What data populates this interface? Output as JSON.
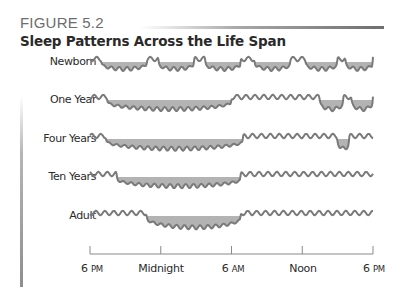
{
  "figure": {
    "label": "FIGURE 5.2",
    "title": "Sleep Patterns Across the Life Span"
  },
  "chart_data": {
    "type": "area",
    "title": "Sleep Patterns Across the Life Span",
    "xlabel": "",
    "ylabel": "",
    "x_axis": {
      "ticks": [
        "6 PM",
        "Midnight",
        "6 AM",
        "Noon",
        "6 PM"
      ],
      "range_hours": [
        0,
        24
      ],
      "start": "6 PM"
    },
    "legend": "Shaded dips below the wavy baseline indicate periods of sleep; wavy line above indicates wakefulness",
    "series": [
      {
        "name": "Newborn",
        "sleep_periods_hours": [
          [
            1.0,
            4.8
          ],
          [
            5.8,
            8.8
          ],
          [
            9.8,
            12.8
          ],
          [
            14.0,
            17.0
          ],
          [
            18.3,
            21.0
          ],
          [
            21.7,
            24.0
          ]
        ]
      },
      {
        "name": "One Year",
        "sleep_periods_hours": [
          [
            1.5,
            12.0
          ],
          [
            19.5,
            21.5
          ],
          [
            22.2,
            24.0
          ]
        ]
      },
      {
        "name": "Four Years",
        "sleep_periods_hours": [
          [
            1.4,
            13.0
          ],
          [
            21.0,
            22.0
          ]
        ]
      },
      {
        "name": "Ten Years",
        "sleep_periods_hours": [
          [
            2.3,
            12.8
          ]
        ]
      },
      {
        "name": "Adult",
        "sleep_periods_hours": [
          [
            4.8,
            12.8
          ]
        ]
      }
    ]
  },
  "rows": [
    {
      "label": "Newborn"
    },
    {
      "label": "One Year"
    },
    {
      "label": "Four Years"
    },
    {
      "label": "Ten Years"
    },
    {
      "label": "Adult"
    }
  ],
  "axis": {
    "ticks": [
      {
        "num": "6",
        "suffix": "PM"
      },
      {
        "num": "Midnight",
        "suffix": ""
      },
      {
        "num": "6",
        "suffix": "AM"
      },
      {
        "num": "Noon",
        "suffix": ""
      },
      {
        "num": "6",
        "suffix": "PM"
      }
    ]
  },
  "colors": {
    "line": "#7a7a7a",
    "fill": "#b3b3b3",
    "axis": "#8a8a8a"
  }
}
